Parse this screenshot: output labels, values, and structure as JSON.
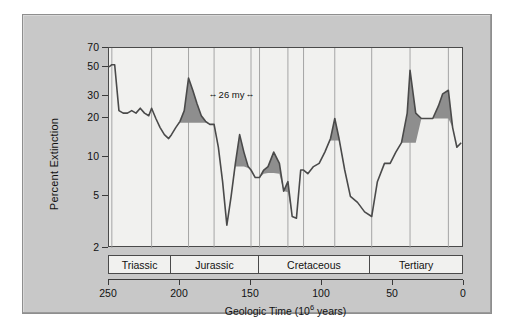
{
  "figure": {
    "background": "#ffffff",
    "panel_color": "#c8c8c8",
    "plot_background": "#f1f1ef",
    "line_color": "#4a4a4a",
    "fill_color": "#8e8e8e"
  },
  "chart_data": {
    "type": "area",
    "title": "",
    "xlabel": "Geologic Time (10⁶ years)",
    "ylabel": "Percent Extinction",
    "xlim": [
      250,
      0
    ],
    "ylim": [
      2,
      70
    ],
    "yscale": "log",
    "xscale": "linear",
    "x_reversed": true,
    "grid": "vertical-only",
    "legend": "none",
    "yticks": [
      70,
      50,
      30,
      20,
      10,
      5,
      2
    ],
    "ytick_labels": [
      "70",
      "50",
      "30",
      "20",
      "10",
      "5",
      "2"
    ],
    "xticks": [
      250,
      200,
      150,
      100,
      50,
      0
    ],
    "xtick_labels": [
      "250",
      "200",
      "150",
      "100",
      "50",
      "0"
    ],
    "annotations": [
      {
        "text": "26 my",
        "type": "double-arrow-span",
        "x_start": 176,
        "x_end": 150,
        "y": 42
      }
    ],
    "periods": [
      {
        "name": "Triassic",
        "start": 250,
        "end": 206
      },
      {
        "name": "Jurassic",
        "start": 206,
        "end": 144
      },
      {
        "name": "Cretaceous",
        "start": 144,
        "end": 65
      },
      {
        "name": "Tertiary",
        "start": 65,
        "end": 0
      }
    ],
    "extinction_peaks_mya": [
      248,
      220,
      194,
      176,
      150,
      144,
      124,
      113,
      91,
      65,
      38,
      11
    ],
    "series": [
      {
        "name": "Percent extinction of marine animal genera",
        "x": [
          250,
          248,
          246,
          243,
          240,
          237,
          234,
          231,
          228,
          225,
          222,
          220,
          217,
          214,
          211,
          208,
          206,
          203,
          200,
          197,
          194,
          191,
          188,
          185,
          182,
          179,
          176,
          173,
          170,
          167,
          164,
          161,
          158,
          155,
          152,
          150,
          147,
          144,
          141,
          138,
          134,
          130,
          127,
          124,
          121,
          118,
          115,
          113,
          110,
          106,
          102,
          98,
          94,
          91,
          88,
          84,
          80,
          75,
          70,
          65,
          61,
          56,
          52,
          48,
          44,
          40,
          38,
          34,
          30,
          26,
          22,
          18,
          15,
          11,
          8,
          5,
          2
        ],
        "y": [
          50,
          52,
          52,
          23,
          22,
          22,
          23,
          22,
          24,
          22,
          21,
          24,
          20,
          17,
          15,
          14,
          15,
          17,
          19,
          23,
          41,
          33,
          26,
          21,
          19,
          18,
          18,
          12,
          6.5,
          3,
          5,
          9,
          15,
          11,
          8.5,
          8,
          7,
          7,
          8,
          8.5,
          11,
          9,
          5.5,
          6.5,
          3.5,
          3.4,
          8,
          8,
          7.5,
          8.5,
          9,
          11,
          14,
          20,
          14,
          8,
          5,
          4.5,
          3.8,
          3.5,
          6.5,
          9,
          9,
          11,
          13,
          22,
          47,
          22,
          20,
          20,
          20,
          25,
          31,
          33,
          17,
          12,
          13
        ],
        "baseline_y": [
          50,
          52,
          52,
          23,
          22,
          22,
          23,
          22,
          24,
          22,
          21,
          24,
          20,
          17,
          15,
          14,
          15,
          17,
          18.5,
          18.5,
          18.5,
          18.5,
          18.5,
          18.5,
          18.5,
          18,
          18,
          12,
          6.5,
          3,
          5,
          8.5,
          8.5,
          8.5,
          8.3,
          8,
          7,
          7,
          7.5,
          7.6,
          7.6,
          7.5,
          5.5,
          5.4,
          3.5,
          3.4,
          8,
          8,
          7.5,
          8.5,
          9,
          11,
          13.5,
          13.5,
          13.5,
          8,
          5,
          4.5,
          3.8,
          3.5,
          6.5,
          9,
          9,
          11,
          13,
          13,
          13,
          13,
          20,
          20,
          20,
          20,
          20,
          20,
          17,
          12,
          13
        ]
      }
    ]
  },
  "axis": {
    "y_title": "Percent Extinction",
    "x_title_prefix": "Geologic Time (10",
    "x_title_exp": "6",
    "x_title_suffix": " years)"
  }
}
